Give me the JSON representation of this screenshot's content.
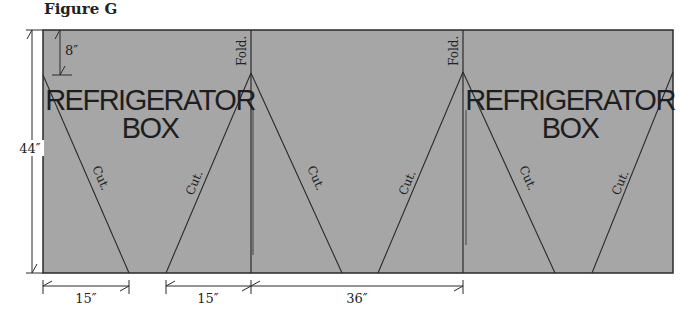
{
  "figure": {
    "title": "Figure G",
    "colors": {
      "panel": "#a6a6a6",
      "line": "#2a2a2a",
      "background": "#ffffff"
    },
    "box_labels": [
      {
        "line1": "REFRIGERATOR",
        "line2": "BOX"
      },
      {
        "line1": "REFRIGERATOR",
        "line2": "BOX"
      }
    ],
    "fold_labels": [
      "Fold.",
      "Fold."
    ],
    "cut_labels": [
      "Cut.",
      "Cut.",
      "Cut.",
      "Cut.",
      "Cut.",
      "Cut."
    ],
    "dimensions": {
      "height": "44″",
      "top_offset": "8″",
      "bottom": [
        "15″",
        "15″",
        "36″"
      ]
    }
  }
}
